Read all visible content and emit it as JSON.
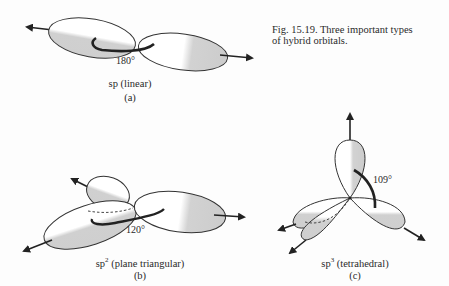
{
  "caption": {
    "line1": "Fig. 15.19.  Three important types",
    "line2": "of hybrid orbitals."
  },
  "panels": [
    {
      "id": "a",
      "angle": "180°",
      "name_base": "sp",
      "name_sup": "",
      "name_rest": " (linear)",
      "letter": "(a)"
    },
    {
      "id": "b",
      "angle": "120°",
      "name_base": "sp",
      "name_sup": "2",
      "name_rest": " (plane triangular)",
      "letter": "(b)"
    },
    {
      "id": "c",
      "angle": "109°",
      "name_base": "sp",
      "name_sup": "3",
      "name_rest": " (tetrahedral)",
      "letter": "(c)"
    }
  ],
  "colors": {
    "lobe_fill": "#d4d4d4",
    "outline": "#333333",
    "background": "#fdfdfd"
  }
}
